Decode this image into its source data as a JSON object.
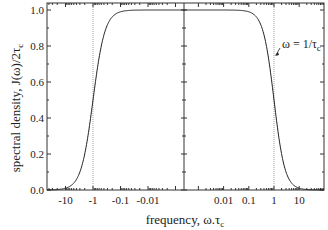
{
  "chart_data": {
    "type": "line",
    "title": "",
    "xlabel": "frequency, ω.τc",
    "ylabel": "spectral density, J(ω)/2τc",
    "x_scale": "symmetric-log",
    "x_tick_labels": [
      "-10",
      "-1",
      "-0.1",
      "-0.01",
      "0.01",
      "0.1",
      "1",
      "10"
    ],
    "x_ticks": [
      -10,
      -1,
      -0.1,
      -0.01,
      0.01,
      0.1,
      1,
      10
    ],
    "y_tick_labels": [
      "0.0",
      "0.2",
      "0.4",
      "0.6",
      "0.8",
      "1.0"
    ],
    "y_ticks": [
      0.0,
      0.2,
      0.4,
      0.6,
      0.8,
      1.0
    ],
    "ylim": [
      0,
      1.03
    ],
    "xlim": [
      -20,
      100
    ],
    "grid": false,
    "series": [
      {
        "name": "J(ω)/2τc = 1/(1+(ωτc)²)",
        "x": [
          -20,
          -10,
          -5,
          -3,
          -2,
          -1,
          -0.5,
          -0.3,
          -0.1,
          -0.01,
          -0.001,
          0.001,
          0.01,
          0.1,
          0.3,
          0.5,
          1,
          2,
          3,
          5,
          10,
          30,
          100
        ],
        "values": [
          0.002,
          0.01,
          0.038,
          0.1,
          0.2,
          0.5,
          0.8,
          0.917,
          0.99,
          1.0,
          1.0,
          1.0,
          1.0,
          0.99,
          0.917,
          0.8,
          0.5,
          0.2,
          0.1,
          0.038,
          0.01,
          0.001,
          0.0001
        ]
      }
    ],
    "reference_lines": [
      {
        "x": -1,
        "style": "dotted"
      },
      {
        "x": 1,
        "style": "dotted"
      },
      {
        "x": 0,
        "style": "solid",
        "note": "central axis with y ticks"
      }
    ],
    "annotations": [
      {
        "text": "ω = 1/τc",
        "points_to_x": 1,
        "points_to_y": 0.72
      }
    ]
  },
  "labels": {
    "ylabel_main": "spectral density, J(ω)/2τ",
    "ylabel_sub": "c",
    "xlabel_main": "frequency, ω.τ",
    "xlabel_sub": "c",
    "annot_main": "ω = 1/τ",
    "annot_sub": "c"
  }
}
